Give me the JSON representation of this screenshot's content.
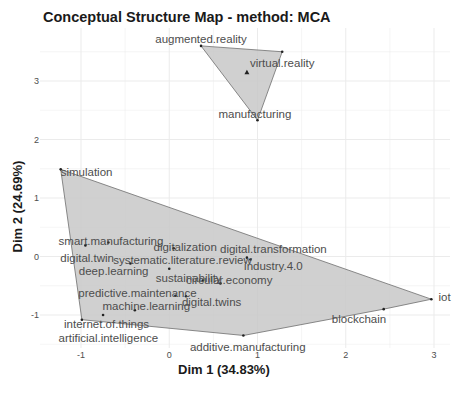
{
  "chart_data": {
    "type": "scatter",
    "title": "Conceptual Structure Map - method: MCA",
    "xlabel": "Dim 1 (34.83%)",
    "ylabel": "Dim 2 (24.69%)",
    "xlim": [
      -1.35,
      3.3
    ],
    "ylim": [
      -1.55,
      3.75
    ],
    "x_ticks": [
      -1,
      0,
      1,
      2,
      3
    ],
    "y_ticks": [
      -1,
      0,
      1,
      2,
      3
    ],
    "grid": true,
    "legend": "none",
    "clusters": [
      {
        "id": 1,
        "fill": "#c8c8c8",
        "centroid": {
          "x": 0.88,
          "y": 3.15
        },
        "hull": [
          "augmented.reality",
          "virtual.reality",
          "manufacturing"
        ],
        "points": [
          {
            "label": "augmented.reality",
            "x": 0.36,
            "y": 3.6,
            "lx": 0.36,
            "ly": 3.72,
            "anchor": "middle"
          },
          {
            "label": "virtual.reality",
            "x": 1.28,
            "y": 3.5,
            "lx": 1.28,
            "ly": 3.3,
            "anchor": "middle"
          },
          {
            "label": "manufacturing",
            "x": 1.0,
            "y": 2.33,
            "lx": 0.97,
            "ly": 2.43,
            "anchor": "middle"
          }
        ]
      },
      {
        "id": 2,
        "fill": "#c8c8c8",
        "centroid": null,
        "hull": [
          "simulation",
          "iot",
          "blockchain",
          "additive.manufacturing",
          "artificial.intelligence"
        ],
        "points": [
          {
            "label": "simulation",
            "x": -1.23,
            "y": 1.49,
            "lx": -1.23,
            "ly": 1.45,
            "anchor": "start"
          },
          {
            "label": "smart.manufacturing",
            "x": -0.69,
            "y": 0.24,
            "lx": -0.66,
            "ly": 0.27,
            "anchor": "middle"
          },
          {
            "label": "digital.twin",
            "x": -0.95,
            "y": 0.19,
            "lx": -0.93,
            "ly": -0.02,
            "anchor": "middle"
          },
          {
            "label": "digitalization",
            "x": 0.05,
            "y": 0.14,
            "lx": 0.18,
            "ly": 0.17,
            "anchor": "middle"
          },
          {
            "label": "systematic.literature.review",
            "x": -0.44,
            "y": -0.12,
            "lx": 0.15,
            "ly": -0.06,
            "anchor": "middle"
          },
          {
            "label": "digital.transformation",
            "x": 0.88,
            "y": -0.02,
            "lx": 1.18,
            "ly": 0.13,
            "anchor": "middle"
          },
          {
            "label": "industry.4.0",
            "x": 0.92,
            "y": -0.05,
            "lx": 1.18,
            "ly": -0.17,
            "anchor": "middle"
          },
          {
            "label": "deep.learning",
            "x": 0.0,
            "y": -0.21,
            "lx": -0.63,
            "ly": -0.25,
            "anchor": "middle"
          },
          {
            "label": "sustainability",
            "x": 0.38,
            "y": -0.41,
            "lx": 0.22,
            "ly": -0.36,
            "anchor": "middle"
          },
          {
            "label": "circular.economy",
            "x": 0.58,
            "y": -0.46,
            "lx": 0.68,
            "ly": -0.41,
            "anchor": "middle"
          },
          {
            "label": "predictive.maintenance",
            "x": 0.07,
            "y": -0.67,
            "lx": -0.36,
            "ly": -0.62,
            "anchor": "middle"
          },
          {
            "label": "digital.twins",
            "x": 0.19,
            "y": -0.68,
            "lx": 0.48,
            "ly": -0.78,
            "anchor": "middle"
          },
          {
            "label": "machine.learning",
            "x": -0.39,
            "y": -0.92,
            "lx": -0.26,
            "ly": -0.85,
            "anchor": "middle"
          },
          {
            "label": "internet.of.things",
            "x": -0.75,
            "y": -1.0,
            "lx": -0.71,
            "ly": -1.16,
            "anchor": "middle"
          },
          {
            "label": "artificial.intelligence",
            "x": -0.99,
            "y": -1.08,
            "lx": -0.69,
            "ly": -1.4,
            "anchor": "middle"
          },
          {
            "label": "additive.manufacturing",
            "x": 0.84,
            "y": -1.35,
            "lx": 0.89,
            "ly": -1.55,
            "anchor": "middle"
          },
          {
            "label": "blockchain",
            "x": 2.43,
            "y": -0.9,
            "lx": 2.15,
            "ly": -1.06,
            "anchor": "middle"
          },
          {
            "label": "iot",
            "x": 2.97,
            "y": -0.73,
            "lx": 3.12,
            "ly": -0.69,
            "anchor": "middle"
          }
        ]
      }
    ]
  },
  "colors": {
    "hull_fill": "#c8c8c8",
    "hull_stroke": "#6e6e6e",
    "grid": "#ebebeb",
    "label": "#4d4d4d",
    "point": "#222222",
    "tick_text": "#4d4d4d"
  }
}
